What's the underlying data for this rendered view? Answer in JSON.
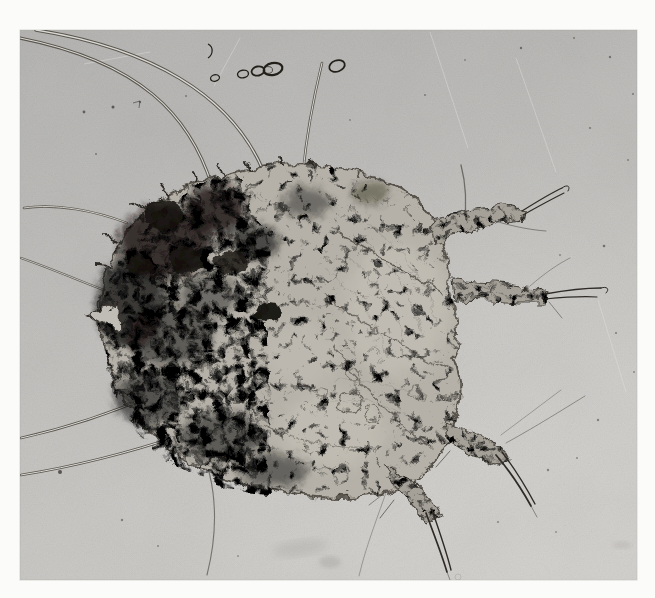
{
  "figure": {
    "kind": "black-and-white photomicrograph",
    "alt": "Black-and-white photomicrograph of a rounded mite with a heavily mottled dark body, short bristled legs extending to the right and bottom, long thin setae curving away to the left and top, and a few small air bubbles near the top of the gray field.",
    "colors": {
      "page_bg": "#fbfbf9",
      "photo_top": "#b0afad",
      "photo_bottom": "#cac8c4",
      "corner_light": "#d8d6d2",
      "photo_edge": "#a6a5a2",
      "body_base": "#b5b1a8",
      "body_edge": "#474239",
      "blotch": "#16130f",
      "leg_base": "#a5a198",
      "seta_dark": "#5a574f",
      "seta_light": "#dbd9d4",
      "bristle_dark": "#2e2b26",
      "bubble_ring": "#23201a",
      "speck": "#3c3a36",
      "scratch": "#e2e1de",
      "smudge": "#8e8d89",
      "detail_line": "#44403a",
      "ring_line": "#55514a",
      "striation": "#7e7b74",
      "light_patch": "#c9c5bc"
    }
  }
}
